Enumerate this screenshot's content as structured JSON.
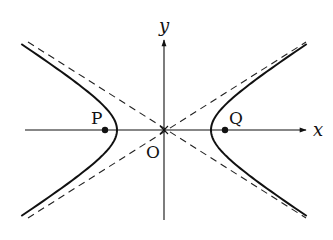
{
  "diagram": {
    "type": "hyperbola",
    "axes": {
      "x_label": "x",
      "y_label": "y",
      "origin_label": "O"
    },
    "points": [
      {
        "label": "P",
        "side": "left"
      },
      {
        "label": "Q",
        "side": "right"
      }
    ],
    "curve": {
      "branches": 2,
      "style": "solid"
    },
    "asymptotes": {
      "count": 2,
      "style": "dashed"
    },
    "colors": {
      "ink": "#111111",
      "background": "#ffffff"
    }
  }
}
